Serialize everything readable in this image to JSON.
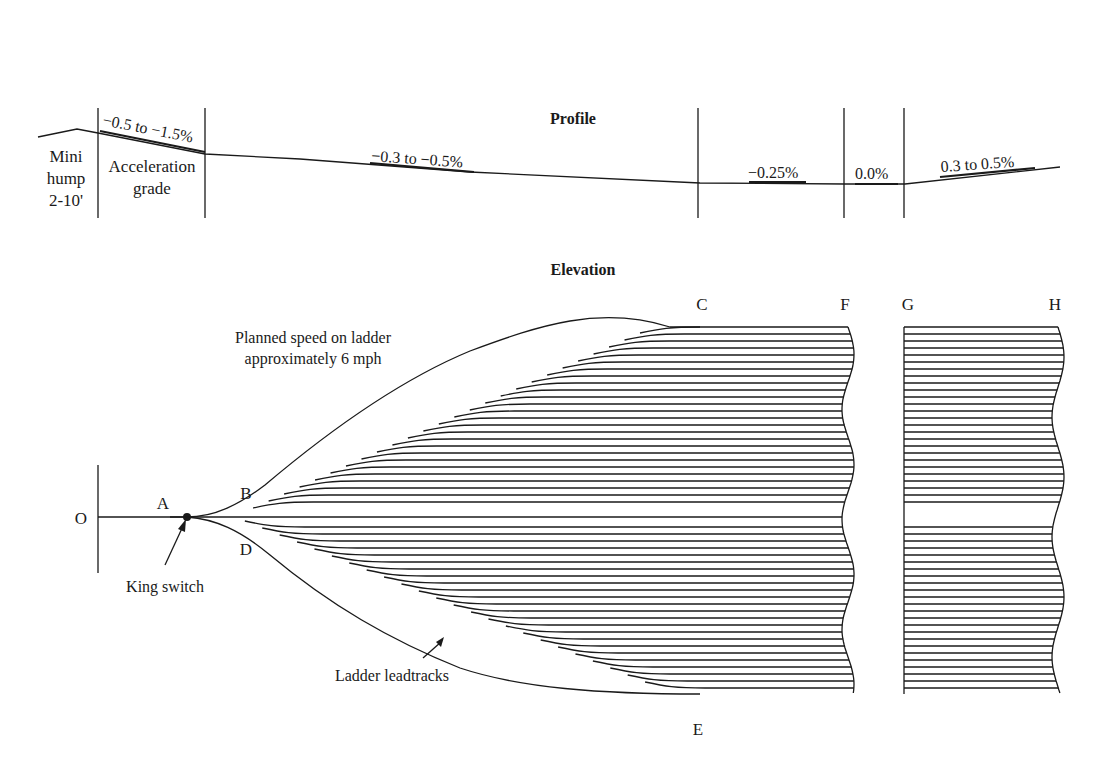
{
  "profile": {
    "title": "Profile",
    "labels": {
      "mini_hump": [
        "Mini",
        "hump",
        "2-10'"
      ],
      "acceleration_grade": [
        "Acceleration",
        "grade"
      ]
    },
    "grades": [
      {
        "id": "accel",
        "text": "−0.5 to −1.5%"
      },
      {
        "id": "ladder",
        "text": "−0.3 to −0.5%"
      },
      {
        "id": "body",
        "text": "−0.25%"
      },
      {
        "id": "flat",
        "text": "0.0%"
      },
      {
        "id": "rise",
        "text": "0.3 to 0.5%"
      }
    ]
  },
  "elevation": {
    "title": "Elevation",
    "points": {
      "O": "O",
      "A": "A",
      "B": "B",
      "C": "C",
      "D": "D",
      "E": "E",
      "F": "F",
      "G": "G",
      "H": "H"
    },
    "notes": {
      "planned_speed": [
        "Planned speed on ladder",
        "approximately 6 mph"
      ],
      "king_switch": "King switch",
      "ladder_leadtracks": "Ladder leadtracks"
    },
    "tracks": {
      "upper_count": 26,
      "lower_count": 24,
      "spacing_px": 7
    }
  },
  "colors": {
    "ink": "#1a1a1a",
    "background": "#ffffff"
  }
}
